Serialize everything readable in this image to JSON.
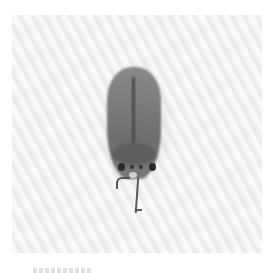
{
  "image": {
    "subject": "insect",
    "description": "Grayscale photo of a small leafhopper-like insect viewed from above on a white textured surface",
    "colors": {
      "background": "#ffffff",
      "surface": "#f3f3f3",
      "insect": "#7b7b7b",
      "eyes": "#2a2a2a"
    }
  }
}
